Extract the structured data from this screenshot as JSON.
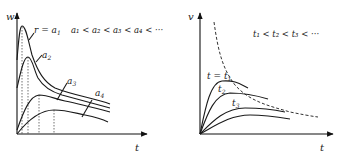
{
  "left_diagram": {
    "y_axis_label": "w",
    "x_axis_label": "t",
    "first_curve_label": "r = a",
    "first_curve_sub": "1",
    "curve_labels": [
      {
        "base": "a",
        "sub": "2"
      },
      {
        "base": "a",
        "sub": "3"
      },
      {
        "base": "a",
        "sub": "4"
      }
    ],
    "ordering_text": "a₁ < a₂ < a₃ < a₄ < ···"
  },
  "right_diagram": {
    "y_axis_label": "v",
    "x_axis_label": "t",
    "first_curve_label": "t = t",
    "first_curve_sub": "1",
    "curve_labels": [
      {
        "base": "t",
        "sub": "2"
      },
      {
        "base": "t",
        "sub": "3"
      }
    ],
    "ordering_text": "t₁ < t₂ < t₃ < ···",
    "envelope": "dashed"
  }
}
